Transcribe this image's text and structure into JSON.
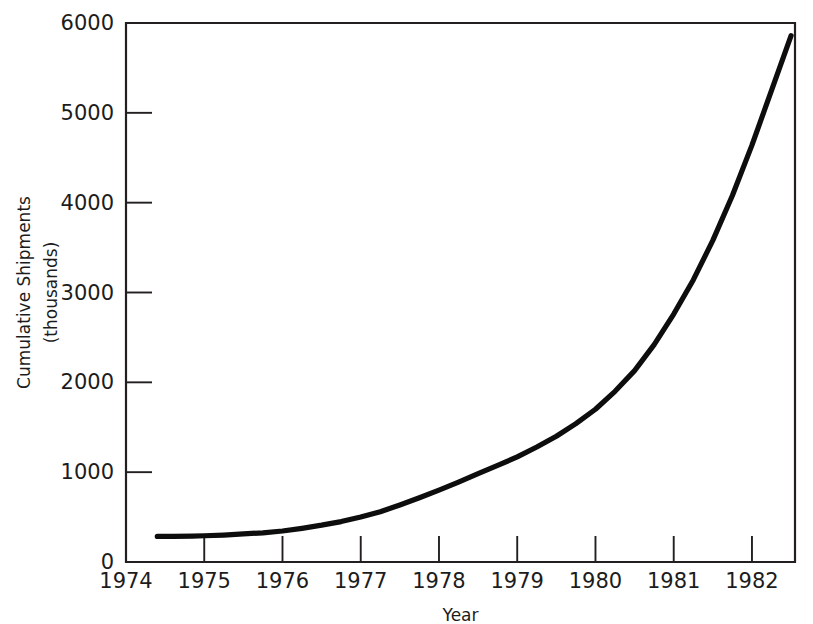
{
  "chart_data": {
    "type": "line",
    "title": "",
    "xlabel": "Year",
    "ylabel": "Cumulative Shipments",
    "ylabel_sub": "(thousands)",
    "xlim": [
      1974,
      1982.55
    ],
    "ylim": [
      0,
      6000
    ],
    "grid": false,
    "legend": null,
    "line_color": "#0d0d0d",
    "axis_color": "#231f20",
    "background": "#ffffff",
    "xticks": [
      1974,
      1975,
      1976,
      1977,
      1978,
      1979,
      1980,
      1981,
      1982
    ],
    "xtick_labels": [
      "1974",
      "1975",
      "1976",
      "1977",
      "1978",
      "1979",
      "1980",
      "1981",
      "1982"
    ],
    "yticks": [
      0,
      1000,
      2000,
      3000,
      4000,
      5000,
      6000
    ],
    "ytick_labels": [
      "0",
      "1000",
      "2000",
      "3000",
      "4000",
      "5000",
      "6000"
    ],
    "series": [
      {
        "name": "Cumulative Shipments",
        "x": [
          1974.4,
          1974.6,
          1974.85,
          1975.0,
          1975.25,
          1975.5,
          1975.75,
          1976.0,
          1976.25,
          1976.5,
          1976.75,
          1977.0,
          1977.25,
          1977.5,
          1977.75,
          1978.0,
          1978.25,
          1978.5,
          1978.75,
          1979.0,
          1979.25,
          1979.5,
          1979.75,
          1980.0,
          1980.25,
          1980.5,
          1980.75,
          1981.0,
          1981.25,
          1981.5,
          1981.75,
          1982.0,
          1982.25,
          1982.5
        ],
        "values": [
          285,
          285,
          288,
          292,
          300,
          312,
          325,
          345,
          375,
          410,
          450,
          500,
          560,
          635,
          715,
          800,
          890,
          985,
          1075,
          1170,
          1280,
          1400,
          1540,
          1700,
          1900,
          2130,
          2420,
          2760,
          3140,
          3580,
          4080,
          4640,
          5250,
          5860
        ]
      }
    ]
  },
  "plot_geometry": {
    "left": 126,
    "right": 795,
    "top": 23,
    "bottom": 562
  }
}
